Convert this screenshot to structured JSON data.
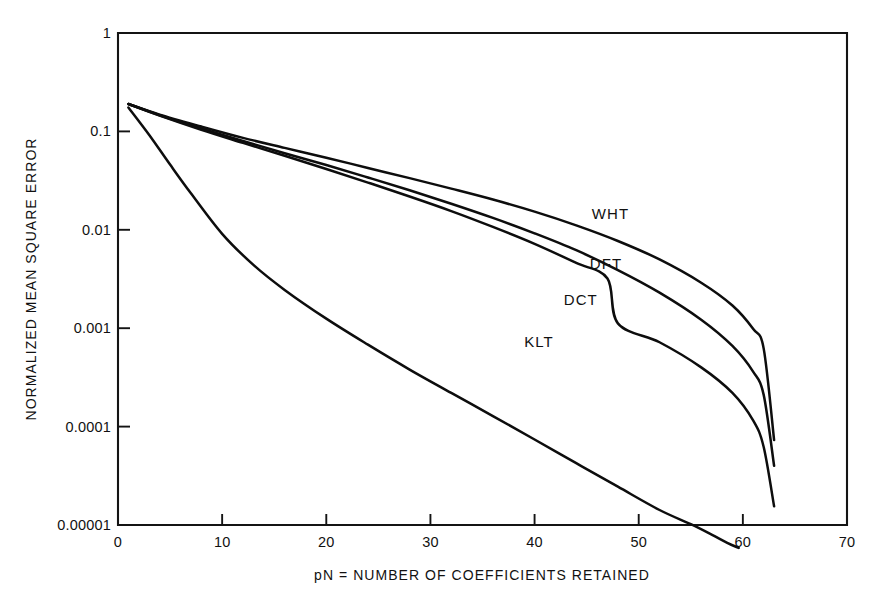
{
  "chart_data": {
    "type": "line",
    "title": "",
    "subtitle": "",
    "xlabel": "pN = NUMBER OF COEFFICIENTS RETAINED",
    "ylabel": "NORMALIZED MEAN SQUARE ERROR",
    "xlim": [
      0,
      70
    ],
    "ylim": [
      1e-05,
      1
    ],
    "yscale": "log",
    "xscale": "linear",
    "grid": false,
    "legend_position": "inline-curve-labels",
    "xticks": [
      0,
      10,
      20,
      30,
      40,
      50,
      60,
      70
    ],
    "xtick_labels": [
      "0",
      "10",
      "20",
      "30",
      "40",
      "50",
      "60",
      "70"
    ],
    "yticks": [
      1,
      0.1,
      0.01,
      0.001,
      0.0001,
      1e-05
    ],
    "ytick_labels": [
      "1",
      "0.1",
      "0.01",
      "0.001",
      "0.0001",
      "0.00001"
    ],
    "series": [
      {
        "name": "WHT",
        "label_position": {
          "x": 45.5,
          "y": 0.0145
        },
        "x": [
          1,
          4,
          8,
          12,
          16,
          20,
          24,
          28,
          32,
          36,
          40,
          44,
          48,
          52,
          56,
          59,
          61,
          62,
          63
        ],
        "y": [
          0.19,
          0.148,
          0.112,
          0.086,
          0.068,
          0.054,
          0.0425,
          0.0335,
          0.0262,
          0.0203,
          0.0153,
          0.0111,
          0.0077,
          0.005,
          0.0029,
          0.0017,
          0.00098,
          0.00062,
          7.3e-05
        ]
      },
      {
        "name": "DFT",
        "label_position": {
          "x": 45.3,
          "y": 0.0045
        },
        "x": [
          1,
          4,
          8,
          12,
          16,
          20,
          24,
          28,
          32,
          36,
          40,
          44,
          48,
          52,
          56,
          59,
          61,
          62,
          63
        ],
        "y": [
          0.19,
          0.146,
          0.107,
          0.08,
          0.06,
          0.0455,
          0.034,
          0.0252,
          0.0184,
          0.0132,
          0.0092,
          0.0062,
          0.0039,
          0.0023,
          0.00122,
          0.00066,
          0.00036,
          0.00021,
          4e-05
        ]
      },
      {
        "name": "DCT",
        "label_position": {
          "x": 42.8,
          "y": 0.00195
        },
        "x": [
          1,
          4,
          8,
          12,
          16,
          20,
          24,
          28,
          32,
          36,
          40,
          44,
          47,
          48,
          52,
          56,
          59,
          61,
          62,
          63
        ],
        "y": [
          0.19,
          0.145,
          0.104,
          0.0765,
          0.0565,
          0.0415,
          0.0302,
          0.0218,
          0.0155,
          0.0107,
          0.0072,
          0.0046,
          0.0032,
          0.00112,
          0.00072,
          0.0004,
          0.00022,
          0.000115,
          6.2e-05,
          1.55e-05
        ]
      },
      {
        "name": "KLT",
        "label_position": {
          "x": 39.0,
          "y": 0.00072
        },
        "x": [
          1,
          3,
          5,
          7,
          10,
          13,
          16,
          20,
          24,
          28,
          32,
          36,
          40,
          44,
          48,
          52,
          55,
          57,
          58.5,
          59.6
        ],
        "y": [
          0.175,
          0.092,
          0.046,
          0.0235,
          0.0091,
          0.0044,
          0.00245,
          0.00125,
          0.00068,
          0.00038,
          0.00022,
          0.000128,
          7.4e-05,
          4.25e-05,
          2.45e-05,
          1.42e-05,
          1.02e-05,
          8e-06,
          6.6e-06,
          5.85e-06
        ]
      }
    ]
  },
  "axes": {
    "x_axis_title": "pN = NUMBER OF COEFFICIENTS RETAINED",
    "y_axis_title": "NORMALIZED MEAN SQUARE ERROR"
  },
  "colors": {
    "curve": "#0d0d0d",
    "axis": "#141414",
    "background": "#ffffff",
    "text": "#111111"
  }
}
